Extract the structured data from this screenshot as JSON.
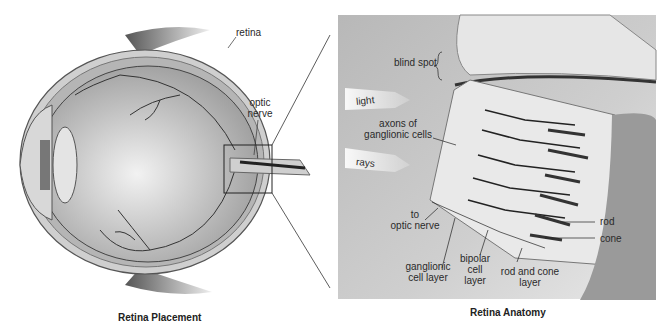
{
  "figure": {
    "left_panel": {
      "caption": "Retina Placement",
      "labels": {
        "retina": "retina",
        "optic_nerve_line1": "optic",
        "optic_nerve_line2": "nerve"
      }
    },
    "right_panel": {
      "caption": "Retina Anatomy",
      "labels": {
        "blind_spot": "blind spot",
        "light": "light",
        "rays": "rays",
        "axons_line1": "axons of",
        "axons_line2": "ganglionic cells",
        "to_optic_line1": "to",
        "to_optic_line2": "optic nerve",
        "rod": "rod",
        "cone": "cone",
        "ganglionic_line1": "ganglionic",
        "ganglionic_line2": "cell layer",
        "bipolar_line1": "bipolar",
        "bipolar_line2": "cell",
        "bipolar_line3": "layer",
        "rodcone_line1": "rod and cone",
        "rodcone_line2": "layer"
      }
    }
  }
}
